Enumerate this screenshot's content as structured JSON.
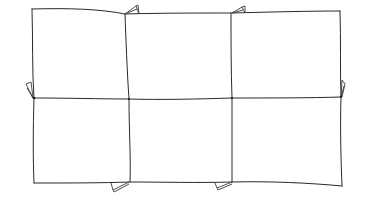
{
  "diagram": {
    "type": "hand-drawn grid sketch",
    "rows": 2,
    "columns": 3,
    "cells": [
      {
        "row": 1,
        "col": 1
      },
      {
        "row": 1,
        "col": 2
      },
      {
        "row": 1,
        "col": 3
      },
      {
        "row": 2,
        "col": 1
      },
      {
        "row": 2,
        "col": 2
      },
      {
        "row": 2,
        "col": 3
      }
    ],
    "fold_tabs": [
      "top-left-divider",
      "top-right-divider",
      "left-middle",
      "right-middle",
      "bottom-left-divider",
      "bottom-right-divider"
    ],
    "stroke_color": "#2a2a2a",
    "background_color": "#ffffff"
  }
}
